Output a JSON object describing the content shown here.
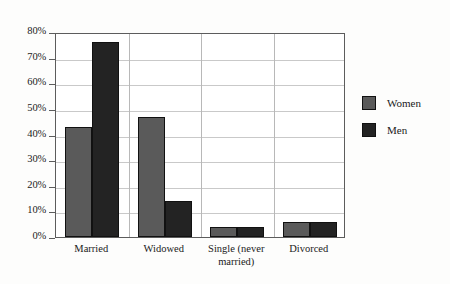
{
  "chart_data": {
    "type": "bar",
    "title": "",
    "xlabel": "",
    "ylabel": "",
    "ylim": [
      0,
      80
    ],
    "ytick_labels": [
      "0%",
      "10%",
      "20%",
      "30%",
      "40%",
      "50%",
      "60%",
      "70%",
      "80%"
    ],
    "ytick_values": [
      0,
      10,
      20,
      30,
      40,
      50,
      60,
      70,
      80
    ],
    "grid": true,
    "legend_position": "right",
    "categories": [
      "Married",
      "Widowed",
      "Single (never married)",
      "Divorced"
    ],
    "series": [
      {
        "name": "Women",
        "color": "#5a5a5a",
        "values": [
          43,
          47,
          4,
          6
        ]
      },
      {
        "name": "Men",
        "color": "#232323",
        "values": [
          76,
          14,
          4,
          6
        ]
      }
    ]
  },
  "legend": {
    "items": [
      {
        "label": "Women"
      },
      {
        "label": "Men"
      }
    ]
  },
  "axis": {
    "ticks": [
      {
        "label": "80%",
        "value": 80
      },
      {
        "label": "70%",
        "value": 70
      },
      {
        "label": "60%",
        "value": 60
      },
      {
        "label": "50%",
        "value": 50
      },
      {
        "label": "40%",
        "value": 40
      },
      {
        "label": "30%",
        "value": 30
      },
      {
        "label": "20%",
        "value": 20
      },
      {
        "label": "10%",
        "value": 10
      },
      {
        "label": "0%",
        "value": 0
      }
    ]
  },
  "categories": [
    {
      "label": "Married"
    },
    {
      "label": "Widowed"
    },
    {
      "label": "Single (never married)"
    },
    {
      "label": "Divorced"
    }
  ]
}
